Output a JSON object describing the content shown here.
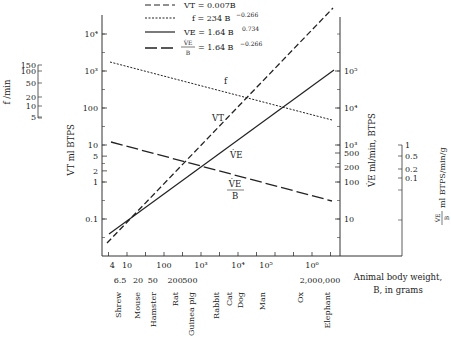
{
  "chart_data": {
    "type": "line",
    "title": "",
    "xlabel": "Animal body weight, B, in grams",
    "xscale": "log",
    "xlim": [
      3,
      5000000
    ],
    "x_ticks": [
      "4",
      "10",
      "100",
      "10³",
      "10⁴",
      "10⁵",
      "10⁶"
    ],
    "x_ticks_secondary": [
      "6.5",
      "20",
      "50",
      "200",
      "500",
      "2,000,000"
    ],
    "animals": [
      {
        "name": "Shrew",
        "weight": 6.5
      },
      {
        "name": "Mouse",
        "weight": 20
      },
      {
        "name": "Hamster",
        "weight": 50
      },
      {
        "name": "Rat",
        "weight": 200
      },
      {
        "name": "Guinea pig",
        "weight": 500
      },
      {
        "name": "Rabbit",
        "weight": 2000
      },
      {
        "name": "Cat",
        "weight": 4000
      },
      {
        "name": "Dog",
        "weight": 10000
      },
      {
        "name": "Man",
        "weight": 70000
      },
      {
        "name": "Ox",
        "weight": 500000
      },
      {
        "name": "Elephant",
        "weight": 2000000
      }
    ],
    "y_axes": [
      {
        "name": "f/min",
        "label": "f /min",
        "ticks": [
          "150",
          "100",
          "50",
          "20",
          "10",
          "5"
        ]
      },
      {
        "name": "VT",
        "label": "VT ml BTPS",
        "ticks": [
          "10⁴",
          "10³",
          "100",
          "10",
          "5",
          "2",
          "1",
          "0.1"
        ]
      },
      {
        "name": "VE",
        "label": "V̇E ml/min, BTPS",
        "ticks": [
          "10⁵",
          "10⁴",
          "10³",
          "500",
          "200",
          "100",
          "10"
        ]
      },
      {
        "name": "VE/B",
        "label": "V̇E/B ml BTPS/min/g",
        "ticks": [
          "1",
          "0.5",
          "0.2",
          "0.1"
        ]
      }
    ],
    "legend": [
      {
        "style": "long-dash",
        "text": "VT = 0.007B"
      },
      {
        "style": "dotted",
        "text": "f = 234 B^-0.266"
      },
      {
        "style": "solid",
        "text": "VE = 1.64 B^0.734"
      },
      {
        "style": "dash-dash",
        "text": "VE/B = 1.64 B^-0.266"
      }
    ],
    "series": [
      {
        "name": "VT",
        "formula": "VT = 0.007B",
        "x": [
          4,
          5000000
        ],
        "values": [
          0.028,
          35000
        ]
      },
      {
        "name": "f",
        "formula": "f = 234 B^-0.266",
        "x": [
          4,
          5000000
        ],
        "values": [
          160,
          4.5
        ]
      },
      {
        "name": "VE",
        "formula": "VE = 1.64 B^0.734",
        "x": [
          4,
          5000000
        ],
        "values": [
          4.4,
          1300000
        ]
      },
      {
        "name": "VE/B",
        "formula": "VE/B = 1.64 B^-0.266",
        "x": [
          4,
          5000000
        ],
        "values": [
          1.1,
          0.026
        ]
      }
    ],
    "curve_labels": [
      "f",
      "VT",
      "V̇E",
      "V̇E/B"
    ],
    "grid": false,
    "legend_position": "top"
  },
  "labels": {
    "legend_vt": "VT = 0.007B",
    "legend_f": "f = 234 B",
    "legend_f_exp": "−0.266",
    "legend_ve": "VE = 1.64 B",
    "legend_ve_exp": "0.734",
    "legend_veb": "= 1.64 B",
    "legend_veb_exp": "−0.266",
    "ve_dot": "V̇E",
    "b": "B",
    "axis_f": "f /min",
    "axis_vt": "VT ml BTPS",
    "axis_ve": "V̇E ml/min, BTPS",
    "axis_veb": "ml BTPS/min/g",
    "xlabel_1": "Animal body weight,",
    "xlabel_2": "B, in grams",
    "curve_f": "f",
    "curve_vt": "VT",
    "curve_ve": "V̇E"
  }
}
